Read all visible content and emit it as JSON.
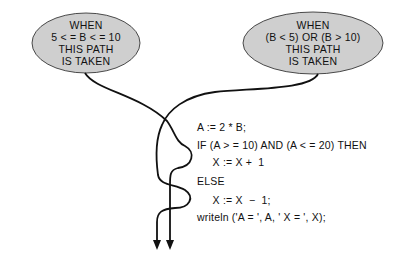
{
  "bubbles": {
    "left": {
      "lines": [
        "WHEN",
        "5 < = B < = 10",
        "THIS PATH",
        "IS TAKEN"
      ],
      "fill": "#cfcfcf"
    },
    "right": {
      "lines": [
        "WHEN",
        "(B < 5) OR (B > 10)",
        "THIS PATH",
        "IS TAKEN"
      ],
      "fill": "#cfcfcf"
    }
  },
  "code": {
    "lines": [
      "A := 2 * B;",
      "IF (A > = 10) AND (A < = 20) THEN",
      "     X := X +  1",
      "ELSE",
      "     X := X  −  1;",
      "writeln ('A = ', A, ' X = ', X);"
    ]
  },
  "paths": {
    "true_path_label": "path-when-5-le-b-le-10",
    "false_path_label": "path-when-b-lt-5-or-b-gt-10",
    "stroke": "#111111"
  }
}
